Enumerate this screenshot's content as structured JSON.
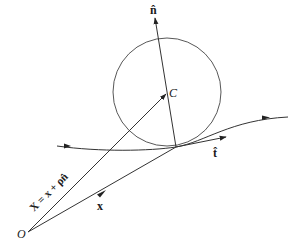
{
  "diagram": {
    "labels": {
      "normal": "n̂",
      "tangent": "t̂",
      "center": "C",
      "origin": "O",
      "position": "x",
      "center_vector": "X = x + ρn̂"
    },
    "colors": {
      "stroke": "#333333",
      "text": "#1a1a1a",
      "background": "#ffffff"
    },
    "geometry": {
      "circle": {
        "cx": 167,
        "cy": 92,
        "r": 54
      },
      "origin": [
        28,
        232
      ],
      "tangent_point": [
        176,
        147
      ],
      "center": [
        167,
        93
      ],
      "normal_tip": [
        155,
        18
      ],
      "tangent_tip": [
        226,
        137
      ],
      "curve": {
        "start": [
          57,
          146
        ],
        "end": [
          288,
          117
        ]
      }
    }
  }
}
